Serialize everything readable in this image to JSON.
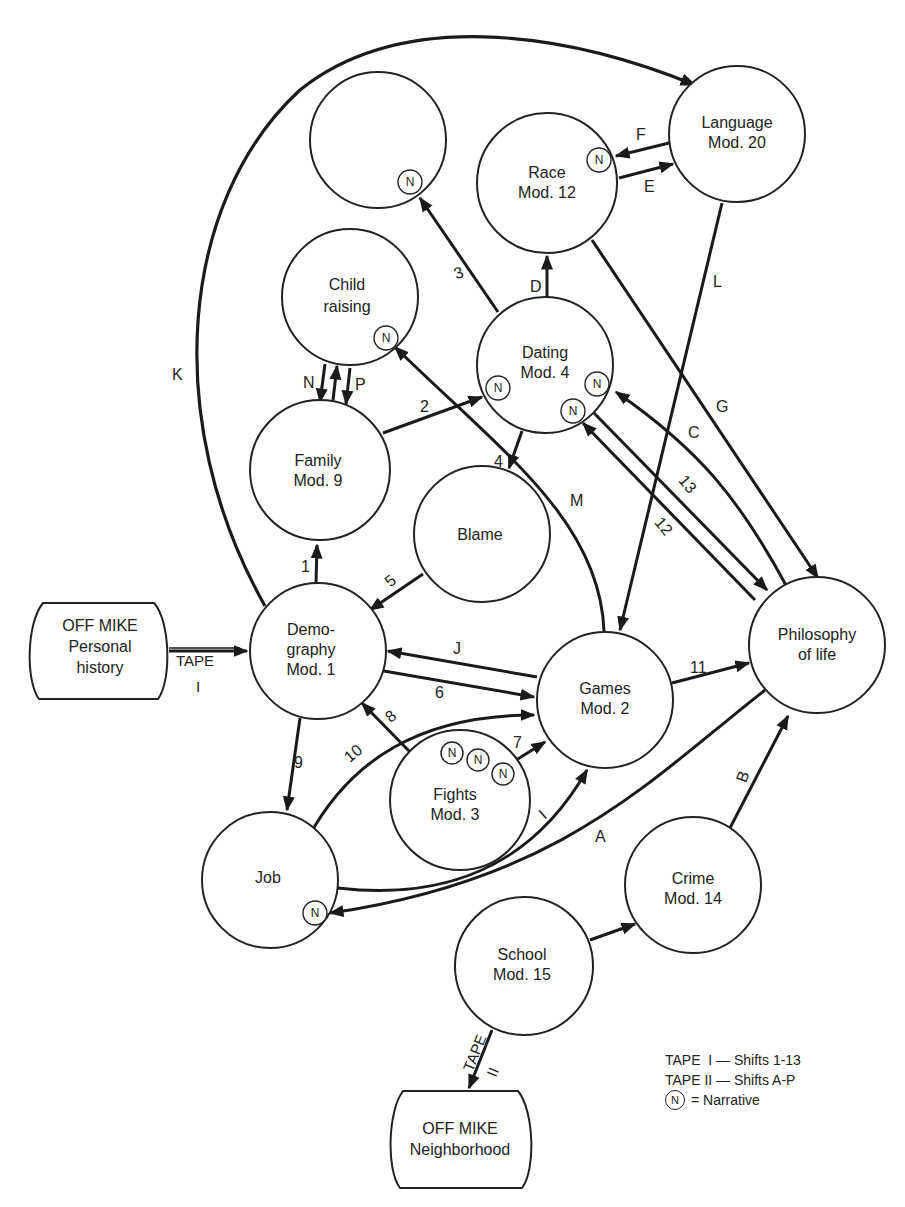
{
  "diagram": {
    "title": "",
    "nodes": {
      "empty_top": {
        "lines": [
          "",
          ""
        ],
        "narrative": true
      },
      "race": {
        "lines": [
          "Race",
          "Mod. 12"
        ],
        "narrative": true
      },
      "language": {
        "lines": [
          "Language",
          "Mod. 20"
        ],
        "narrative": false
      },
      "child_raising": {
        "lines": [
          "Child",
          "raising"
        ],
        "narrative": true
      },
      "dating": {
        "lines": [
          "Dating",
          "Mod. 4"
        ],
        "narrative_count": 3
      },
      "family": {
        "lines": [
          "Family",
          "Mod. 9"
        ],
        "narrative": false
      },
      "blame": {
        "lines": [
          "Blame",
          ""
        ],
        "narrative": false
      },
      "demography": {
        "lines": [
          "Demo-",
          "graphy",
          "Mod. 1"
        ],
        "narrative": false
      },
      "games": {
        "lines": [
          "Games",
          "Mod. 2"
        ],
        "narrative": false
      },
      "philosophy": {
        "lines": [
          "Philosophy",
          "of life"
        ],
        "narrative": false
      },
      "fights": {
        "lines": [
          "Fights",
          "Mod. 3"
        ],
        "narrative_count": 3
      },
      "job": {
        "lines": [
          "Job",
          ""
        ],
        "narrative": true
      },
      "crime": {
        "lines": [
          "Crime",
          "Mod. 14"
        ],
        "narrative": false
      },
      "school": {
        "lines": [
          "School",
          "Mod. 15"
        ],
        "narrative": false
      },
      "off_mike_personal": {
        "lines": [
          "OFF MIKE",
          "Personal",
          "history"
        ]
      },
      "off_mike_neighborhood": {
        "lines": [
          "OFF MIKE",
          "Neighborhood"
        ]
      }
    },
    "narrative_marker": "N",
    "edges": [
      {
        "id": "tape1",
        "label": "TAPE",
        "sublabel": "I",
        "from": "off_mike_personal",
        "to": "demography"
      },
      {
        "id": "1",
        "label": "1",
        "from": "demography",
        "to": "family"
      },
      {
        "id": "2",
        "label": "2",
        "from": "family",
        "to": "dating"
      },
      {
        "id": "3",
        "label": "3",
        "from": "dating",
        "to": "empty_top"
      },
      {
        "id": "4",
        "label": "4",
        "from": "dating",
        "to": "blame"
      },
      {
        "id": "5",
        "label": "5",
        "from": "blame",
        "to": "demography"
      },
      {
        "id": "6",
        "label": "6",
        "from": "demography",
        "to": "games"
      },
      {
        "id": "7",
        "label": "7",
        "from": "fights",
        "to": "games"
      },
      {
        "id": "8",
        "label": "8",
        "from": "fights",
        "to": "demography"
      },
      {
        "id": "9",
        "label": "9",
        "from": "demography",
        "to": "job"
      },
      {
        "id": "10",
        "label": "10",
        "from": "job",
        "to": "games"
      },
      {
        "id": "11",
        "label": "11",
        "from": "games",
        "to": "philosophy"
      },
      {
        "id": "12",
        "label": "12",
        "from": "philosophy",
        "to": "dating"
      },
      {
        "id": "13",
        "label": "13",
        "from": "dating",
        "to": "philosophy"
      },
      {
        "id": "A",
        "label": "A",
        "from": "school",
        "to": "crime"
      },
      {
        "id": "B",
        "label": "B",
        "from": "crime",
        "to": "philosophy"
      },
      {
        "id": "C",
        "label": "C",
        "from": "philosophy",
        "to": "dating"
      },
      {
        "id": "D",
        "label": "D",
        "from": "dating",
        "to": "race"
      },
      {
        "id": "E",
        "label": "E",
        "from": "race",
        "to": "language"
      },
      {
        "id": "F",
        "label": "F",
        "from": "language",
        "to": "race"
      },
      {
        "id": "G",
        "label": "G",
        "from": "race",
        "to": "philosophy"
      },
      {
        "id": "H",
        "label": "H",
        "from": "philosophy",
        "to": "job"
      },
      {
        "id": "I",
        "label": "I",
        "from": "job",
        "to": "games"
      },
      {
        "id": "J",
        "label": "J",
        "from": "games",
        "to": "demography"
      },
      {
        "id": "K",
        "label": "K",
        "from": "demography",
        "to": "language"
      },
      {
        "id": "L",
        "label": "L",
        "from": "language",
        "to": "games"
      },
      {
        "id": "M",
        "label": "M",
        "from": "games",
        "to": "child_raising"
      },
      {
        "id": "N",
        "label": "N",
        "from": "child_raising",
        "to": "family"
      },
      {
        "id": "O",
        "label": "O",
        "from": "family",
        "to": "child_raising"
      },
      {
        "id": "P",
        "label": "P",
        "from": "child_raising",
        "to": "family"
      },
      {
        "id": "tape2",
        "label": "TAPE",
        "sublabel": "II",
        "from": "school",
        "to": "off_mike_neighborhood"
      }
    ]
  },
  "legend": {
    "line1": "TAPE  I — Shifts 1-13",
    "line2": "TAPE II — Shifts A-P",
    "narrative_symbol": "N",
    "narrative_text": "= Narrative"
  }
}
